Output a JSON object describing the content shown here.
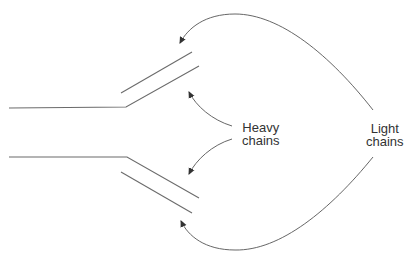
{
  "diagram": {
    "type": "antibody-structure",
    "labels": {
      "heavy": {
        "line1": "Heavy",
        "line2": "chains"
      },
      "light": {
        "line1": "Light",
        "line2": "chains"
      }
    },
    "colors": {
      "stroke": "#6b6b6b",
      "arrow": "#555555",
      "text": "#333333",
      "background": "#ffffff"
    }
  }
}
